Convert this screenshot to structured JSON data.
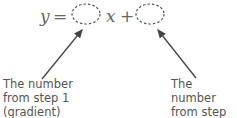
{
  "equation": {
    "y": "y",
    "equals": "=",
    "x": "x",
    "plus": "+"
  },
  "labels": {
    "left": {
      "line1": "The number",
      "line2": "from step 1",
      "line3": "(gradient)"
    },
    "right": {
      "line1": "The number",
      "line2": "from step 2",
      "line3": "(y-intercept)"
    }
  }
}
